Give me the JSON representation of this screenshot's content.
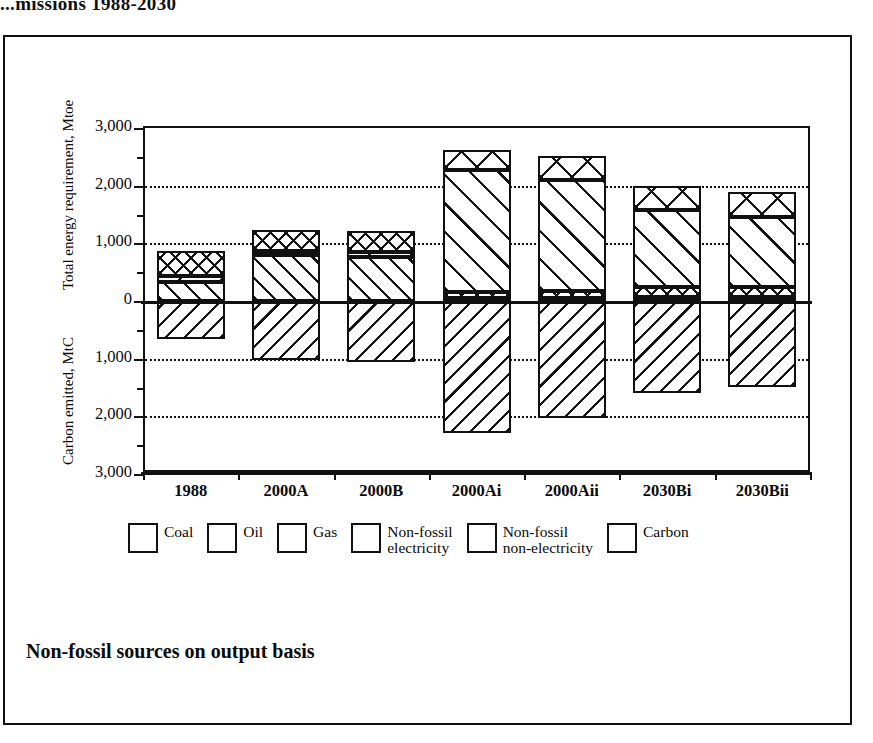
{
  "running_title": "...missions 1988-2030",
  "caption": "Non-fossil sources on output basis",
  "axis": {
    "top_title": "Total energy requirement, Mtoe",
    "bottom_title": "Carbon emitted, MtC",
    "ytick_labels": [
      "3,000",
      "2,000",
      "1,000",
      "0",
      "1,000",
      "2,000",
      "3,000"
    ]
  },
  "legend": {
    "items": [
      {
        "key": "coal",
        "label": "Coal",
        "pattern": "pat-coal"
      },
      {
        "key": "oil",
        "label": "Oil",
        "pattern": "pat-oil"
      },
      {
        "key": "gas",
        "label": "Gas",
        "pattern": "pat-gas"
      },
      {
        "key": "nfe",
        "label": "Non-fossil\nelectricity",
        "pattern": "pat-nfe"
      },
      {
        "key": "nfne",
        "label": "Non-fossil\nnon-electricity",
        "pattern": "pat-nfne"
      },
      {
        "key": "carbon",
        "label": "Carbon",
        "pattern": "pat-carbon"
      }
    ]
  },
  "chart_data": {
    "type": "bar",
    "title": "",
    "subtitle": "Non-fossil sources on output basis",
    "xlabel": "",
    "ylabel_top": "Total energy requirement, Mtoe",
    "ylabel_bottom": "Carbon emitted, MtC",
    "ylim": [
      -3000,
      3000
    ],
    "ytick_values": [
      3000,
      2000,
      1000,
      0,
      -1000,
      -2000,
      -3000
    ],
    "ytick_labels": [
      "3,000",
      "2,000",
      "1,000",
      "0",
      "1,000",
      "2,000",
      "3,000"
    ],
    "grid": "horizontal dotted at +2000, +1000, -1000, -2000",
    "legend_position": "below plot",
    "stacked": true,
    "note": "Positive axis = total energy requirement (Mtoe); negative axis = carbon emitted (MtC, plotted downward as positive magnitude).",
    "categories": [
      "1988",
      "2000A",
      "2000B",
      "2000Ai",
      "2000Aii",
      "2030Bi",
      "2030Bii"
    ],
    "series": [
      {
        "name": "Coal",
        "key": "coal",
        "values": [
          330,
          790,
          760,
          0,
          0,
          0,
          0
        ]
      },
      {
        "name": "Gas",
        "key": "gas",
        "values": [
          105,
          85,
          95,
          60,
          60,
          70,
          70
        ]
      },
      {
        "name": "Oil",
        "key": "oil",
        "values": [
          430,
          355,
          355,
          100,
          110,
          170,
          180
        ]
      },
      {
        "name": "Non-fossil electricity",
        "key": "nfe",
        "values": [
          0,
          0,
          0,
          2120,
          1920,
          1330,
          1215
        ]
      },
      {
        "name": "Non-fossil non-electricity",
        "key": "nfne",
        "values": [
          0,
          0,
          0,
          330,
          430,
          430,
          420
        ]
      },
      {
        "name": "Carbon",
        "key": "carbon",
        "values": [
          -660,
          -1020,
          -1060,
          -2290,
          -2030,
          -1600,
          -1490
        ]
      }
    ]
  }
}
